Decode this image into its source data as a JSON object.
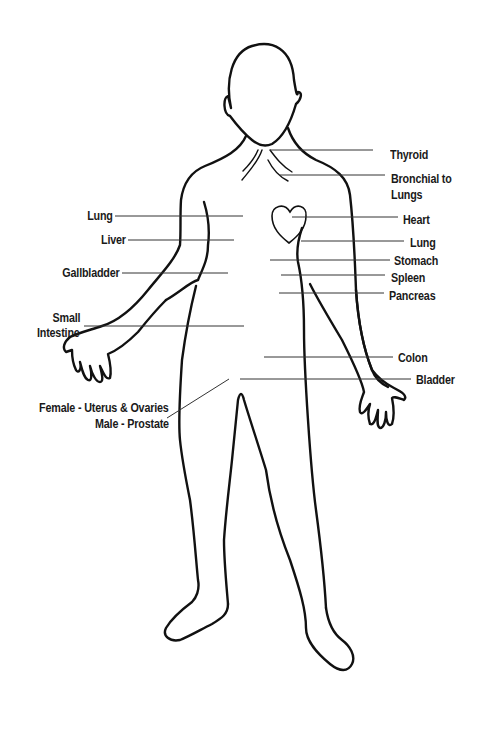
{
  "diagram": {
    "title": "",
    "labels_right": [
      {
        "id": "thyroid",
        "text": "Thyroid",
        "x": 390,
        "y": 148
      },
      {
        "id": "bronchial",
        "text": "Bronchial to",
        "x": 391,
        "y": 172
      },
      {
        "id": "bronchial2",
        "text": "Lungs",
        "x": 391,
        "y": 188
      },
      {
        "id": "heart",
        "text": "Heart",
        "x": 403,
        "y": 213
      },
      {
        "id": "lung-right",
        "text": "Lung",
        "x": 410,
        "y": 236
      },
      {
        "id": "stomach",
        "text": "Stomach",
        "x": 394,
        "y": 254
      },
      {
        "id": "spleen",
        "text": "Spleen",
        "x": 391,
        "y": 272
      },
      {
        "id": "pancreas",
        "text": "Pancreas",
        "x": 389,
        "y": 290
      },
      {
        "id": "colon",
        "text": "Colon",
        "x": 398,
        "y": 350
      },
      {
        "id": "bladder",
        "text": "Bladder",
        "x": 416,
        "y": 373
      }
    ],
    "labels_left": [
      {
        "id": "lung-left",
        "text": "Lung",
        "right": 372,
        "y": 209
      },
      {
        "id": "liver",
        "text": "Liver",
        "right": 359,
        "y": 233
      },
      {
        "id": "gallbladder",
        "text": "Gallbladder",
        "right": 366,
        "y": 266
      },
      {
        "id": "small-intestine",
        "text": "Small",
        "right": 406,
        "y": 311
      },
      {
        "id": "small-intestine2",
        "text": "Intestine",
        "right": 406,
        "y": 326
      },
      {
        "id": "female",
        "text": "Female - Uterus & Ovaries",
        "right": 317,
        "y": 401
      },
      {
        "id": "male",
        "text": "Male - Prostate",
        "right": 317,
        "y": 417
      }
    ]
  }
}
